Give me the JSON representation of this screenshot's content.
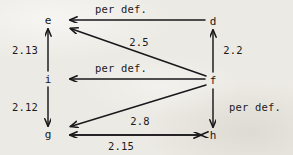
{
  "diagram": {
    "type": "directed-graph",
    "background_color": "#eceae4",
    "ink_color": "#19171a",
    "nodes": [
      {
        "id": "e",
        "label": "e",
        "x": 48,
        "y": 20
      },
      {
        "id": "d",
        "label": "d",
        "x": 213,
        "y": 21
      },
      {
        "id": "i",
        "label": "i",
        "x": 48,
        "y": 79
      },
      {
        "id": "f",
        "label": "f",
        "x": 213,
        "y": 80
      },
      {
        "id": "g",
        "label": "g",
        "x": 48,
        "y": 134
      },
      {
        "id": "h",
        "label": "h",
        "x": 213,
        "y": 135
      }
    ],
    "edges": [
      {
        "id": "d-to-e",
        "from": "d",
        "to": "e",
        "label": "per def.",
        "label_x": 121,
        "label_y": 9,
        "directed": "single"
      },
      {
        "id": "f-to-e",
        "from": "f",
        "to": "e",
        "label": "2.5",
        "label_x": 139,
        "label_y": 42,
        "directed": "single"
      },
      {
        "id": "i-to-e",
        "from": "i",
        "to": "e",
        "label": "2.13",
        "label_x": 25,
        "label_y": 50,
        "directed": "single"
      },
      {
        "id": "f-to-d",
        "from": "f",
        "to": "d",
        "label": "2.2",
        "label_x": 233,
        "label_y": 50,
        "directed": "single"
      },
      {
        "id": "f-to-i",
        "from": "f",
        "to": "i",
        "label": "per def.",
        "label_x": 121,
        "label_y": 68,
        "directed": "single"
      },
      {
        "id": "i-to-g",
        "from": "i",
        "to": "g",
        "label": "2.12",
        "label_x": 25,
        "label_y": 107,
        "directed": "single"
      },
      {
        "id": "f-to-h",
        "from": "f",
        "to": "h",
        "label": "per def.",
        "label_x": 255,
        "label_y": 107,
        "directed": "single"
      },
      {
        "id": "f-to-g",
        "from": "f",
        "to": "g",
        "label": "2.8",
        "label_x": 140,
        "label_y": 121,
        "directed": "single"
      },
      {
        "id": "g-and-h",
        "from": "g",
        "to": "h",
        "label": "2.15",
        "label_x": 121,
        "label_y": 146,
        "directed": "double"
      }
    ]
  }
}
